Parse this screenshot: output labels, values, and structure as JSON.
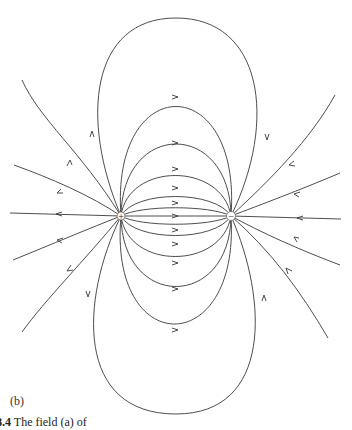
{
  "figure": {
    "panel_label": "(b)",
    "caption_number": "8.4",
    "caption_text": "The field (a) of",
    "charges": [
      {
        "sign": "+",
        "symbol": "+",
        "x": 121,
        "y": 216
      },
      {
        "sign": "-",
        "symbol": "−",
        "x": 231,
        "y": 216
      }
    ],
    "line_color": "#3a3a3a",
    "background": "#ffffff"
  }
}
